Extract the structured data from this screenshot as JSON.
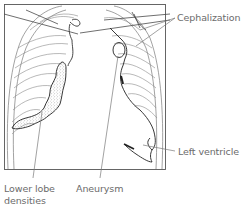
{
  "diagram": {
    "type": "chest-xray-illustration",
    "labels": {
      "cephalization": "Cephalization",
      "left_ventricle": "Left ventricle",
      "lower_lobe_line1": "Lower lobe",
      "lower_lobe_line2": "densities",
      "aneurysm": "Aneurysm"
    },
    "colors": {
      "line": "#3a3a3a",
      "light_line": "#8a8a8a",
      "label_text": "#6b6b6b",
      "background": "#ffffff"
    }
  }
}
